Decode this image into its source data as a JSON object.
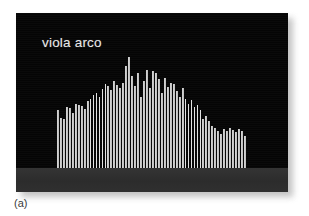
{
  "figure": {
    "caption": "(a)",
    "panel_label": "viola arco",
    "background_color": "#ffffff",
    "panel_color": "#050505",
    "floor_color": "#2f2f2f",
    "bar_color": "#c9c9c9",
    "label_color": "#e8e8e8",
    "caption_color": "#3a3a3a"
  },
  "chart_data": {
    "type": "bar",
    "title": "viola arco",
    "subtitle": "",
    "xlabel": "",
    "ylabel": "",
    "grid": false,
    "legend": null,
    "axis_ticks_visible": false,
    "categories": [
      "1",
      "2",
      "3",
      "4",
      "5",
      "6",
      "7",
      "8",
      "9",
      "10",
      "11",
      "12",
      "13",
      "14",
      "15",
      "16",
      "17",
      "18",
      "19",
      "20",
      "21",
      "22",
      "23",
      "24",
      "25",
      "26",
      "27",
      "28",
      "29",
      "30",
      "31",
      "32",
      "33",
      "34",
      "35",
      "36",
      "37",
      "38",
      "39",
      "40",
      "41",
      "42",
      "43",
      "44",
      "45",
      "46",
      "47",
      "48",
      "49",
      "50",
      "51",
      "52",
      "53",
      "54",
      "55",
      "56",
      "57",
      "58",
      "59",
      "60",
      "61",
      "62",
      "63",
      "64"
    ],
    "values": [
      52,
      45,
      44,
      55,
      54,
      50,
      58,
      57,
      56,
      53,
      60,
      62,
      66,
      68,
      64,
      71,
      76,
      74,
      70,
      78,
      75,
      72,
      77,
      92,
      100,
      83,
      74,
      86,
      64,
      78,
      88,
      72,
      87,
      86,
      80,
      68,
      81,
      73,
      77,
      76,
      69,
      64,
      72,
      62,
      58,
      61,
      55,
      57,
      52,
      44,
      47,
      42,
      38,
      36,
      33,
      31,
      35,
      33,
      36,
      34,
      32,
      35,
      33,
      29
    ],
    "ylim": [
      0,
      100
    ],
    "xlim": [
      1,
      64
    ]
  }
}
